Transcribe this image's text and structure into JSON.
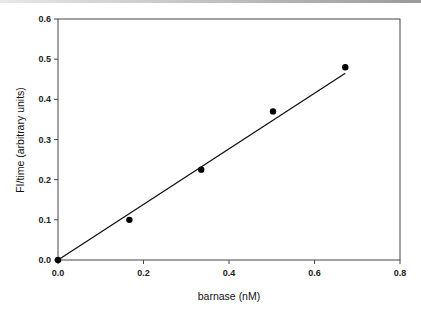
{
  "chart_data": {
    "type": "scatter",
    "title": "",
    "xlabel": "barnase (nM)",
    "ylabel": "FI/time (arbitrary units)",
    "xlim": [
      0,
      0.8
    ],
    "ylim": [
      0,
      0.6
    ],
    "x_ticks": [
      0.0,
      0.2,
      0.4,
      0.6,
      0.8
    ],
    "x_tick_labels": [
      "0.0",
      "0.2",
      "0.4",
      "0.6",
      "0.8"
    ],
    "y_ticks": [
      0.0,
      0.1,
      0.2,
      0.3,
      0.4,
      0.5,
      0.6
    ],
    "y_tick_labels": [
      "0.0",
      "0.1",
      "0.2",
      "0.3",
      "0.4",
      "0.5",
      "0.6"
    ],
    "grid": false,
    "legend": null,
    "series": [
      {
        "name": "data",
        "marker": "filled-circle",
        "x": [
          0.0,
          0.167,
          0.335,
          0.503,
          0.672
        ],
        "y": [
          0.0,
          0.1,
          0.225,
          0.37,
          0.48
        ]
      },
      {
        "name": "linear fit",
        "style": "line",
        "x": [
          0.0,
          0.672
        ],
        "y": [
          0.0,
          0.465
        ]
      }
    ]
  }
}
